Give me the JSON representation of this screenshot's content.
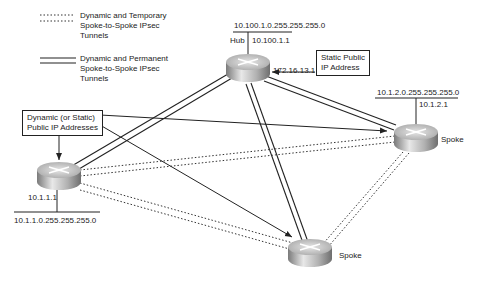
{
  "legend": {
    "items": [
      {
        "style": "dotted",
        "label_lines": [
          "Dynamic and Temporary",
          "Spoke-to-Spoke IPsec",
          "Tunnels"
        ]
      },
      {
        "style": "double",
        "label_lines": [
          "Dynamic and Permanent",
          "Spoke-to-Spoke IPsec",
          "Tunnels"
        ]
      }
    ]
  },
  "hub": {
    "label": "Hub",
    "network": "10.100.1.0.255.255.255.0",
    "ip": "10.100.1.1",
    "public_ip": "172.16.13.1",
    "callout": [
      "Static Public",
      "IP Address"
    ]
  },
  "spoke_left": {
    "network": "10.1.1.0.255.255.255.0",
    "ip": "10.1.1.1",
    "callout": [
      "Dynamic (or Static)",
      "Public IP Addresses"
    ]
  },
  "spoke_right": {
    "label": "Spoke",
    "network": "10.1.2.0.255.255.255.0",
    "ip": "10.1.2.1"
  },
  "spoke_bottom": {
    "label": "Spoke"
  },
  "colors": {
    "line": "#222222",
    "router_top": "#d8d8d8",
    "router_side": "#9a9a9a"
  }
}
